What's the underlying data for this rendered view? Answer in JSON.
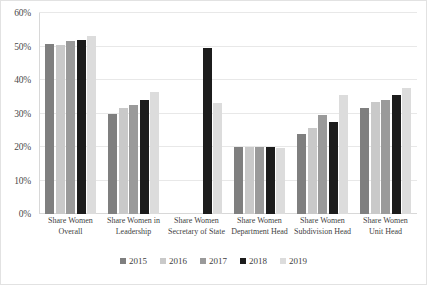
{
  "chart_data": {
    "type": "bar",
    "title": "",
    "xlabel": "",
    "ylabel": "",
    "ylim": [
      0,
      60
    ],
    "ytick_labels": [
      "60%",
      "50%",
      "40%",
      "30%",
      "20%",
      "10%",
      "0%"
    ],
    "ytick_values": [
      60,
      50,
      40,
      30,
      20,
      10,
      0
    ],
    "grid": true,
    "legend_position": "bottom",
    "categories": [
      "Share Women Overall",
      "Share Women in Leadership",
      "Share Women Secretary of State",
      "Share Women Department Head",
      "Share Women Subdivision Head",
      "Share Women Unit Head"
    ],
    "category_lines": [
      [
        "Share Women",
        "Overall"
      ],
      [
        "Share Women in",
        "Leadership"
      ],
      [
        "Share Women",
        "Secretary of State"
      ],
      [
        "Share Women",
        "Department Head"
      ],
      [
        "Share Women",
        "Subdivision Head"
      ],
      [
        "Share Women",
        "Unit Head"
      ]
    ],
    "series": [
      {
        "name": "2015",
        "color": "#7f7f7f",
        "values": [
          50.8,
          30.0,
          0,
          20.0,
          24.0,
          31.5
        ]
      },
      {
        "name": "2016",
        "color": "#c9c9c9",
        "values": [
          50.4,
          31.6,
          0,
          20.1,
          25.6,
          33.5
        ]
      },
      {
        "name": "2017",
        "color": "#9a9a9a",
        "values": [
          51.5,
          32.4,
          0,
          20.1,
          29.6,
          34.0
        ]
      },
      {
        "name": "2018",
        "color": "#1c1c1c",
        "values": [
          52.0,
          34.0,
          49.5,
          19.9,
          27.6,
          35.5
        ]
      },
      {
        "name": "2019",
        "color": "#dcdcdc",
        "values": [
          53.0,
          36.5,
          33.0,
          19.8,
          35.5,
          37.5
        ]
      }
    ]
  },
  "legend": {
    "items": [
      {
        "label": "2015"
      },
      {
        "label": "2016"
      },
      {
        "label": "2017"
      },
      {
        "label": "2018"
      },
      {
        "label": "2019"
      }
    ]
  }
}
